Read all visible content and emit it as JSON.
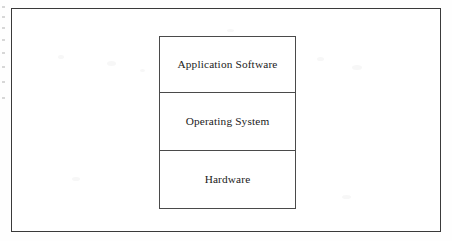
{
  "diagram": {
    "frame": {
      "border_color": "#3a3a3a",
      "background_color": "#ffffff"
    },
    "stack": {
      "border_color": "#4a4a4a",
      "text_color": "#1b1b1b",
      "layers": [
        {
          "label": "Application Software",
          "position": "top"
        },
        {
          "label": "Operating System",
          "position": "middle"
        },
        {
          "label": "Hardware",
          "position": "bottom"
        }
      ]
    }
  }
}
